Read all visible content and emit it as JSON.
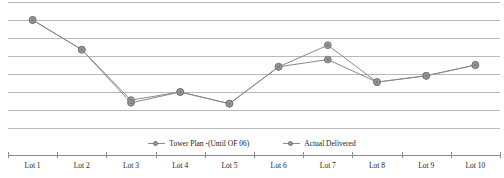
{
  "chart_data": {
    "type": "line",
    "title": "",
    "subtitle": "",
    "xlabel": "",
    "ylabel": "",
    "grid": true,
    "gridlines": 8,
    "legend_position": "bottom",
    "ylim": [
      0,
      7
    ],
    "yticks_visible": false,
    "categories": [
      "Lot 1",
      "Lot 2",
      "Lot 3",
      "Lot 4",
      "Lot 5",
      "Lot 6",
      "Lot 7",
      "Lot 8",
      "Lot 9",
      "Lot 10"
    ],
    "series": [
      {
        "name": "Tower Plan -(Until OF 06)",
        "color": "#8a8a8a",
        "marker": "circle",
        "values": [
          6.0,
          4.35,
          1.4,
          2.0,
          1.35,
          3.4,
          4.6,
          2.55,
          2.9,
          3.5
        ]
      },
      {
        "name": "Actual Delivered",
        "color": "#8a8a8a",
        "marker": "circle",
        "values": [
          6.0,
          4.35,
          1.55,
          2.0,
          1.35,
          3.4,
          3.8,
          2.55,
          2.9,
          3.5
        ]
      }
    ]
  },
  "legend": {
    "items": [
      {
        "label": "Tower Plan -(Until OF 06)"
      },
      {
        "label": "Actual Delivered"
      }
    ]
  },
  "axis": {
    "tick_labels": [
      "Lot 1",
      "Lot 2",
      "Lot 3",
      "Lot 4",
      "Lot 5",
      "Lot 6",
      "Lot 7",
      "Lot 8",
      "Lot 9",
      "Lot 10"
    ]
  },
  "colors": {
    "gridline": "#b9b9b9",
    "series_line": "#8a8a8a",
    "marker_fill": "#9b9b9b",
    "marker_stroke": "#6f6f6f",
    "axis": "#8a8a8a",
    "text": "#1a1a1a",
    "background": "#ffffff"
  }
}
